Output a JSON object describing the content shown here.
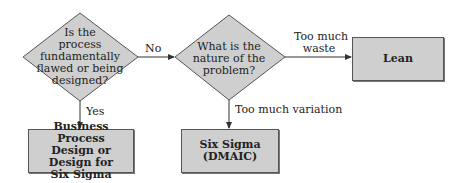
{
  "diagram": {
    "type": "flowchart",
    "decisions": [
      {
        "id": "d1",
        "text": "Is the process fundamentally flawed or being designed?",
        "lines": [
          "Is the",
          "process",
          "fundamentally",
          "flawed or being",
          "designed?"
        ]
      },
      {
        "id": "d2",
        "text": "What is the nature of the problem?",
        "lines": [
          "What is the",
          "nature of the",
          "problem?"
        ]
      }
    ],
    "outcomes": [
      {
        "id": "o1",
        "text": "Business Process Design or Design for Six Sigma",
        "lines": [
          "Business Process",
          "Design or Design for",
          "Six Sigma"
        ]
      },
      {
        "id": "o2",
        "text": "Six Sigma (DMAIC)"
      },
      {
        "id": "o3",
        "text": "Lean"
      }
    ],
    "edges": [
      {
        "from": "d1",
        "to": "d2",
        "label": "No"
      },
      {
        "from": "d1",
        "to": "o1",
        "label": "Yes"
      },
      {
        "from": "d2",
        "to": "o3",
        "label": "Too much waste",
        "label_lines": [
          "Too much",
          "waste"
        ]
      },
      {
        "from": "d2",
        "to": "o2",
        "label": "Too much variation"
      }
    ],
    "colors": {
      "fill": "#cfcfcf",
      "stroke": "#555555",
      "line": "#333333"
    }
  }
}
